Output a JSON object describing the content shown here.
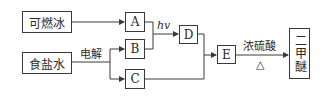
{
  "diagram": {
    "type": "flowchart",
    "nodes": {
      "combustible_ice": "可燃冰",
      "brine": "食盐水",
      "A": "A",
      "B": "B",
      "C": "C",
      "D": "D",
      "E": "E",
      "dimethyl_ether": "二甲醚"
    },
    "edge_labels": {
      "electrolysis": "电解",
      "light": "hv",
      "conc_sulfuric_acid": "浓硫酸",
      "heat": "△"
    },
    "edges": [
      {
        "from": "可燃冰",
        "to": "A"
      },
      {
        "from": "食盐水",
        "to": "B",
        "label": "电解"
      },
      {
        "from": "食盐水",
        "to": "C",
        "label": "电解"
      },
      {
        "from": "A+B",
        "to": "D",
        "label": "hv"
      },
      {
        "from": "D+C",
        "to": "E"
      },
      {
        "from": "E",
        "to": "二甲醚",
        "label": "浓硫酸 △"
      }
    ],
    "colors": {
      "line": "#3a3a3a",
      "background": "#ffffff"
    }
  }
}
